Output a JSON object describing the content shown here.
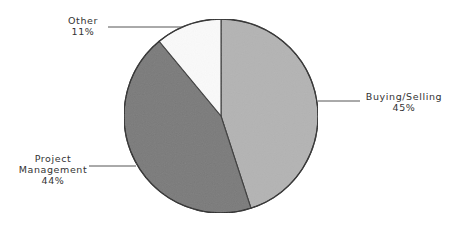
{
  "chart_data": {
    "type": "pie",
    "title": "",
    "categories": [
      "Buying/Selling",
      "Project Management",
      "Other"
    ],
    "values": [
      45,
      44,
      11
    ],
    "unit": "%",
    "start_angle_deg": 0,
    "direction": "clockwise",
    "colors": [
      "#b4b4b4",
      "#7a7a7a",
      "#fafafa"
    ],
    "legend": "none",
    "data_labels": [
      {
        "name": "Buying/Selling",
        "value": "45%"
      },
      {
        "name": "Project Management",
        "value": "44%"
      },
      {
        "name": "Other",
        "value": "11%"
      }
    ]
  },
  "labels": {
    "other": {
      "name": "Other",
      "value": "11%"
    },
    "buying": {
      "name": "Buying/Selling",
      "value": "45%"
    },
    "project": {
      "name_line1": "Project",
      "name_line2": "Management",
      "value": "44%"
    }
  }
}
